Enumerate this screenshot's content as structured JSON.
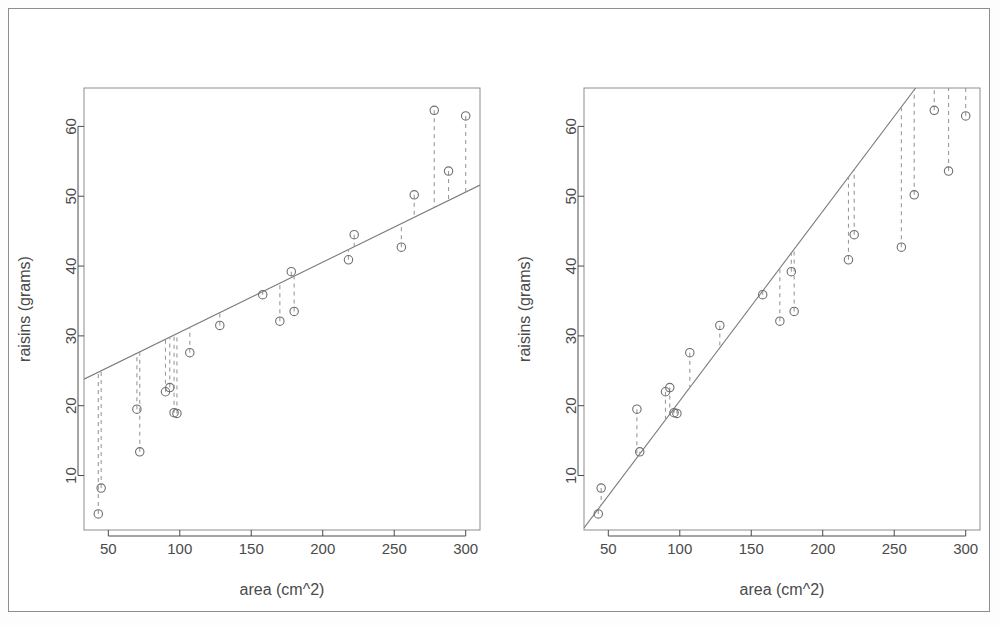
{
  "figure": {
    "kind": "two-panel-scatter-with-residuals",
    "background_color": "#ffffff",
    "frame_color": "#8d8d8d",
    "point_color": "#6f6f6f",
    "line_color": "#7a7a7a",
    "residual_color": "#9a9a9a",
    "text_color": "#4a4a4a"
  },
  "panels": [
    {
      "id": "left",
      "name": "least-squares-fit-panel",
      "xlabel": "area (cm^2)",
      "ylabel": "raisins (grams)",
      "x_ticks": [
        50,
        100,
        150,
        200,
        250,
        300
      ],
      "y_ticks": [
        10,
        20,
        30,
        40,
        50,
        60
      ],
      "xlim": [
        33,
        310
      ],
      "ylim": [
        2.2,
        65.5
      ],
      "fit_line": {
        "x1": 33,
        "y1": 23.8,
        "x2": 310,
        "y2": 51.6
      }
    },
    {
      "id": "right",
      "name": "through-origin-fit-panel",
      "xlabel": "area (cm^2)",
      "ylabel": "raisins (grams)",
      "x_ticks": [
        50,
        100,
        150,
        200,
        250,
        300
      ],
      "y_ticks": [
        10,
        20,
        30,
        40,
        50,
        60
      ],
      "xlim": [
        33,
        310
      ],
      "ylim": [
        2.2,
        65.5
      ],
      "fit_line": {
        "x1": 33,
        "y1": 2.5,
        "x2": 265,
        "y2": 65.5
      }
    }
  ],
  "chart_data": {
    "type": "scatter",
    "title": "",
    "subtitle": "",
    "xlabel": "area (cm^2)",
    "ylabel": "raisins (grams)",
    "xlim": [
      33,
      310
    ],
    "ylim": [
      2.2,
      65.5
    ],
    "xticks": [
      50,
      100,
      150,
      200,
      250,
      300
    ],
    "yticks": [
      10,
      20,
      30,
      40,
      50,
      60
    ],
    "grid": false,
    "legend": null,
    "n_points": 21,
    "x": [
      43,
      45,
      70,
      72,
      90,
      93,
      96,
      98,
      107,
      128,
      158,
      170,
      178,
      180,
      218,
      222,
      255,
      264,
      278,
      288,
      300
    ],
    "y": [
      4.5,
      8.2,
      19.5,
      13.4,
      22.0,
      22.6,
      19.0,
      18.9,
      27.6,
      31.5,
      35.9,
      32.1,
      39.2,
      33.5,
      40.9,
      44.5,
      42.7,
      50.2,
      62.3,
      53.6,
      61.5
    ],
    "series": [
      {
        "name": "observations",
        "marker": "open-circle",
        "x": [
          43,
          45,
          70,
          72,
          90,
          93,
          96,
          98,
          107,
          128,
          158,
          170,
          178,
          180,
          218,
          222,
          255,
          264,
          278,
          288,
          300
        ],
        "values": [
          4.5,
          8.2,
          19.5,
          13.4,
          22.0,
          22.6,
          19.0,
          18.9,
          27.6,
          31.5,
          35.9,
          32.1,
          39.2,
          33.5,
          40.9,
          44.5,
          42.7,
          50.2,
          62.3,
          53.6,
          61.5
        ]
      }
    ],
    "fits": [
      {
        "panel": "left",
        "name": "least-squares-line-with-intercept",
        "style": "solid",
        "intercept": 20.5,
        "slope": 0.1004,
        "endpoints": [
          [
            33,
            23.8
          ],
          [
            310,
            51.6
          ]
        ]
      },
      {
        "panel": "right",
        "name": "regression-through-origin",
        "style": "solid",
        "intercept": -6.45,
        "slope": 0.2716,
        "endpoints": [
          [
            33,
            2.5
          ],
          [
            265,
            65.5
          ]
        ]
      }
    ],
    "residuals_shown": true,
    "residual_style": "dashed-vertical-segments"
  },
  "labels": {
    "xaxis": "area (cm^2)",
    "yaxis": "raisins (grams)"
  }
}
